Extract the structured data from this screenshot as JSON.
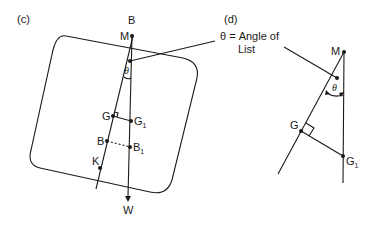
{
  "figure_c": {
    "panel_label": "(c)",
    "points": {
      "B_top": "B",
      "M": "M",
      "theta": "θ",
      "G": "G",
      "G1_main": "G",
      "G1_sub": "1",
      "B": "B",
      "B1_main": "B",
      "B1_sub": "1",
      "K": "K",
      "W": "W"
    }
  },
  "figure_d": {
    "panel_label": "(d)",
    "annotation_line1": "θ = Angle of",
    "annotation_line2": "List",
    "points": {
      "M": "M",
      "theta": "θ",
      "G": "G",
      "G1_main": "G",
      "G1_sub": "1"
    }
  }
}
